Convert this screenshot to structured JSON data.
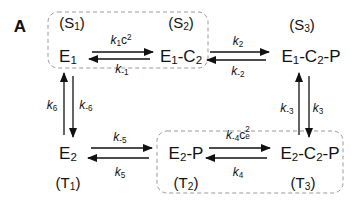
{
  "panel_label": "A",
  "colors": {
    "ink": "#111111",
    "dashed_box": "#9a9a9a",
    "background": "#ffffff"
  },
  "states": {
    "S1": {
      "label": "S",
      "sub": "1"
    },
    "S2": {
      "label": "S",
      "sub": "2"
    },
    "S3": {
      "label": "S",
      "sub": "3"
    },
    "T1": {
      "label": "T",
      "sub": "1"
    },
    "T2": {
      "label": "T",
      "sub": "2"
    },
    "T3": {
      "label": "T",
      "sub": "3"
    }
  },
  "species": {
    "E1": {
      "base": "E",
      "sub": "1"
    },
    "E1C2": {
      "parts": [
        "E",
        "1",
        "-C",
        "2"
      ]
    },
    "E1C2P": {
      "parts": [
        "E",
        "1",
        "-C",
        "2",
        "-P"
      ]
    },
    "E2": {
      "base": "E",
      "sub": "2"
    },
    "E2P": {
      "parts": [
        "E",
        "2",
        "-P"
      ]
    },
    "E2C2P": {
      "parts": [
        "E",
        "2",
        "-C",
        "2",
        "-P"
      ]
    }
  },
  "rates": {
    "k1c2": {
      "k": "k",
      "sub": "1",
      "c": "c",
      "sup": "2"
    },
    "km1": {
      "k": "k",
      "sub": "-1"
    },
    "k2": {
      "k": "k",
      "sub": "2"
    },
    "km2": {
      "k": "k",
      "sub": "-2"
    },
    "k3": {
      "k": "k",
      "sub": "3"
    },
    "km3": {
      "k": "k",
      "sub": "-3"
    },
    "k4": {
      "k": "k",
      "sub": "4"
    },
    "km4ce2": {
      "k": "k",
      "sub": "-4",
      "c": "c",
      "sup": "2",
      "csub": "e"
    },
    "k5": {
      "k": "k",
      "sub": "5"
    },
    "km5": {
      "k": "k",
      "sub": "-5"
    },
    "k6": {
      "k": "k",
      "sub": "6"
    },
    "km6": {
      "k": "k",
      "sub": "-6"
    }
  }
}
